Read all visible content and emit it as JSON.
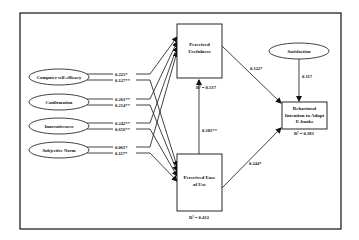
{
  "diagram": {
    "type": "structural-path-model",
    "colors": {
      "stroke": "#111111",
      "background": "#ffffff"
    },
    "exogenous": [
      {
        "id": "cse",
        "label": "Computer self-efficacy",
        "to_pu": "0.225*",
        "to_peou": "0.127**"
      },
      {
        "id": "conf",
        "label": "Confirmation",
        "to_pu": "0.261**",
        "to_peou": "0.214**"
      },
      {
        "id": "innov",
        "label": "Innovativeness",
        "to_pu": "0.242**",
        "to_peou": "0.656**"
      },
      {
        "id": "sn",
        "label": "Subjective Norm",
        "to_pu": "0.061*",
        "to_peou": "0.117*"
      }
    ],
    "satisfaction": {
      "label": "Satisfaction",
      "to_bi": "0.117"
    },
    "pu": {
      "label_line1": "Perceived",
      "label_line2": "Usefulness",
      "r2": "R² = 0.537"
    },
    "peou": {
      "label_line1": "Perceived Ease",
      "label_line2": "of Use",
      "r2": "R² = 0.432",
      "to_pu": "0.181**"
    },
    "bi": {
      "label_line1": "Behavioral",
      "label_line2": "Intention to Adopt",
      "label_line3": "E-books",
      "r2": "R² = 0.381"
    },
    "paths": {
      "pu_to_bi": "0.122*",
      "peou_to_bi": "0.244*"
    }
  }
}
